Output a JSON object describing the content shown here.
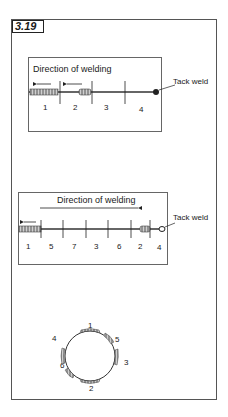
{
  "figure": {
    "label": "3.19"
  },
  "panel1": {
    "title": "Direction of welding",
    "callout": "Tack weld",
    "segments": [
      "1",
      "2",
      "3",
      "4"
    ]
  },
  "panel2": {
    "title": "Direction of welding",
    "callout": "Tack weld",
    "segments": [
      "1",
      "5",
      "7",
      "3",
      "6",
      "2",
      "4"
    ]
  },
  "circle": {
    "positions": [
      {
        "label": "1",
        "where": "top"
      },
      {
        "label": "5",
        "where": "upper-right"
      },
      {
        "label": "3",
        "where": "right"
      },
      {
        "label": "2",
        "where": "bottom"
      },
      {
        "label": "6",
        "where": "lower-left"
      },
      {
        "label": "4",
        "where": "left"
      }
    ]
  },
  "colors": {
    "line": "#333333",
    "bead": "#888888",
    "frame": "#555555"
  }
}
